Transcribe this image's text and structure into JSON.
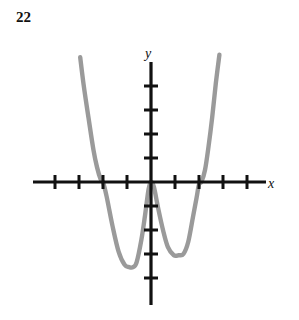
{
  "problem": {
    "number": "22"
  },
  "figure": {
    "name": "polynomial-graph",
    "curve_color": "#9a9a9a",
    "axis_color": "#111111",
    "background_color": "#ffffff",
    "x_axis_label": "x",
    "y_axis_label": "y"
  },
  "chart_data": {
    "type": "line",
    "title": "",
    "subtitle": "",
    "xlabel": "x",
    "ylabel": "y",
    "grid": false,
    "legend": null,
    "axes": {
      "x_axis_y_pixel": 182,
      "y_axis_x_pixel": 151,
      "unit_px_x": 24,
      "unit_px_y": 24,
      "x_tick_values": [
        -4,
        -3,
        -2,
        -1,
        1,
        2,
        3,
        4
      ],
      "y_tick_values": [
        4,
        3,
        2,
        1,
        -1,
        -2,
        -3,
        -4
      ],
      "xlim": [
        -4.9,
        4.7
      ],
      "ylim": [
        -4.9,
        5.2
      ],
      "x_axis_label_text": "x",
      "y_axis_label_text": "y"
    },
    "features": {
      "roots": [
        -2,
        0,
        2
      ],
      "root_behavior": [
        "crosses",
        "touches-tangent-peak",
        "touches-tangent"
      ],
      "local_minima": [
        {
          "x": -0.75,
          "y": -3.55
        },
        {
          "x": 1.35,
          "y": -3.05
        }
      ],
      "local_maxima": [
        {
          "x": 0.0,
          "y": 0.0
        }
      ],
      "end_behavior": "rises on both ends",
      "degree_parity": "even"
    },
    "x": [
      -2.95,
      -2.8,
      -2.6,
      -2.4,
      -2.25,
      -2.1,
      -2.0,
      -1.85,
      -1.6,
      -1.35,
      -1.1,
      -0.9,
      -0.75,
      -0.6,
      -0.4,
      -0.25,
      -0.1,
      0.0,
      0.12,
      0.3,
      0.5,
      0.7,
      0.95,
      1.15,
      1.35,
      1.55,
      1.75,
      1.9,
      2.0,
      2.1,
      2.25,
      2.4,
      2.55,
      2.7,
      2.85
    ],
    "y": [
      5.2,
      4.0,
      2.65,
      1.35,
      0.62,
      0.12,
      0.0,
      -0.6,
      -1.85,
      -2.9,
      -3.45,
      -3.55,
      -3.55,
      -3.35,
      -2.4,
      -1.4,
      -0.3,
      0.0,
      -0.2,
      -1.1,
      -2.0,
      -2.7,
      -3.05,
      -3.05,
      -3.0,
      -2.5,
      -1.45,
      -0.65,
      -0.1,
      0.0,
      0.5,
      1.5,
      2.7,
      4.1,
      5.3
    ]
  }
}
